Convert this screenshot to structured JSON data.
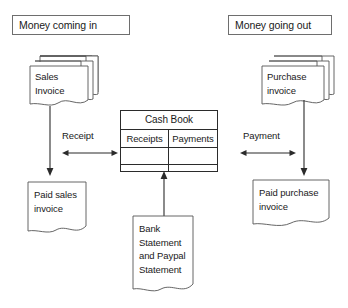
{
  "diagram": {
    "sections": [
      {
        "id": "money-in",
        "label": "Money coming in"
      },
      {
        "id": "money-out",
        "label": "Money going out"
      }
    ],
    "nodes": {
      "sales_invoice": {
        "lines": [
          "Sales",
          "Invoice"
        ],
        "shape": "document-stack"
      },
      "purchase_invoice": {
        "lines": [
          "Purchase",
          "invoice"
        ],
        "shape": "document-stack"
      },
      "paid_sales_invoice": {
        "lines": [
          "Paid sales",
          "invoice"
        ],
        "shape": "document"
      },
      "paid_purchase_invoice": {
        "lines": [
          "Paid purchase",
          "invoice"
        ],
        "shape": "document"
      },
      "bank_statement": {
        "lines": [
          "Bank",
          "Statement",
          "and Paypal",
          "Statement"
        ],
        "shape": "document"
      }
    },
    "cash_book": {
      "title": "Cash Book",
      "columns": [
        "Receipts",
        "Payments"
      ],
      "rows": [
        [
          "",
          ""
        ],
        [
          "",
          ""
        ]
      ]
    },
    "connectors": [
      {
        "id": "receipt",
        "label": "Receipt",
        "style": "double-arrow-horizontal"
      },
      {
        "id": "payment",
        "label": "Payment",
        "style": "double-arrow-horizontal"
      },
      {
        "id": "sales-to-paid",
        "label": "",
        "style": "arrow-down"
      },
      {
        "id": "purchase-to-paid",
        "label": "",
        "style": "arrow-down"
      },
      {
        "id": "bank-to-cashbook",
        "label": "",
        "style": "arrow-up"
      }
    ],
    "colors": {
      "background": "#ffffff",
      "stroke": "#2b2b2b",
      "label_box_stroke": "#6e6e6e",
      "text": "#1a1a1a",
      "doc_stroke": "#555555"
    }
  }
}
